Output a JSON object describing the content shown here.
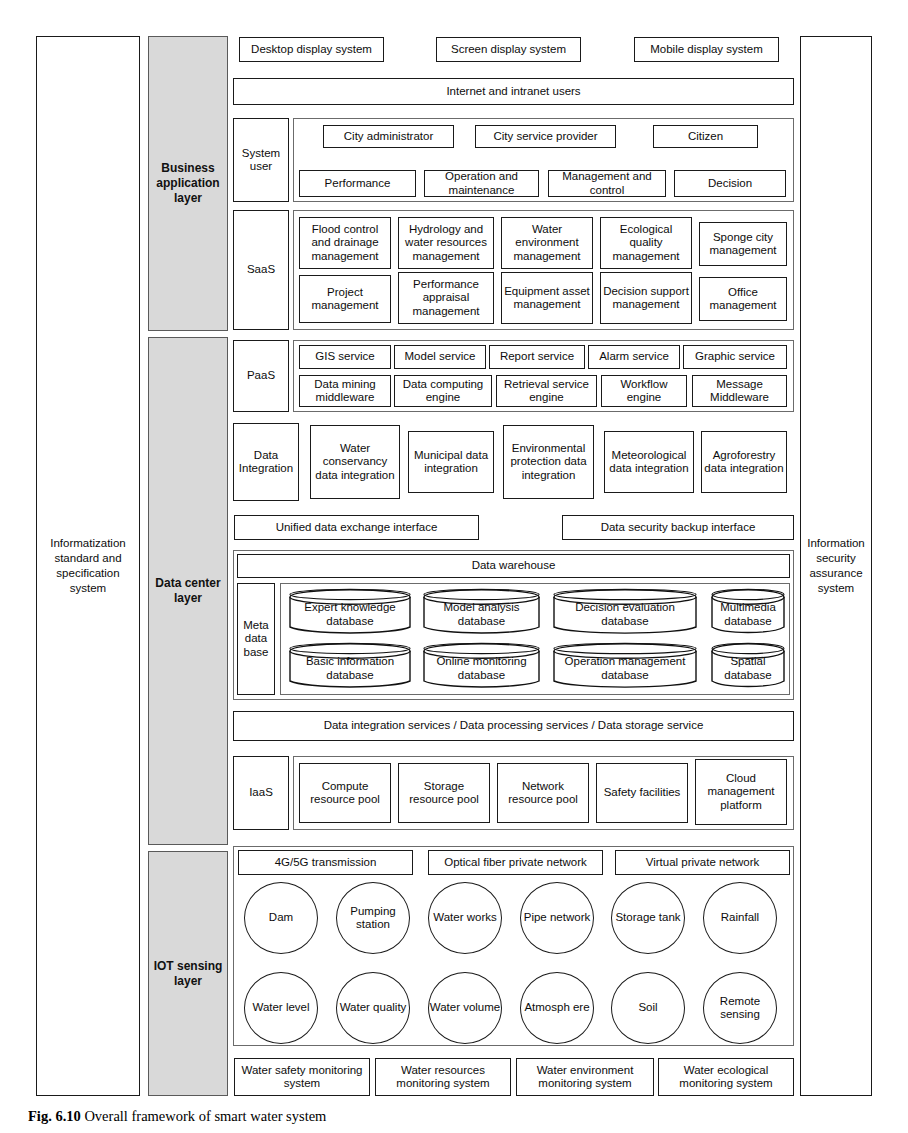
{
  "figure": {
    "caption_label": "Fig. 6.10",
    "caption_text": "Overall framework of smart water system"
  },
  "side_columns": {
    "left": "Informatization standard and specification system",
    "right": "Information security assurance system"
  },
  "layers": [
    {
      "id": "business",
      "label": "Business application layer"
    },
    {
      "id": "data-center",
      "label": "Data center layer"
    },
    {
      "id": "iot",
      "label": "IOT sensing layer"
    }
  ],
  "business_application_layer": {
    "display_systems": [
      "Desktop display system",
      "Screen display system",
      "Mobile display system"
    ],
    "users_bar": "Internet and intranet users",
    "system_user": {
      "label": "System user",
      "roles": [
        "City administrator",
        "City service provider",
        "Citizen"
      ],
      "functions": [
        "Performance",
        "Operation and maintenance",
        "Management and control",
        "Decision"
      ]
    },
    "saas": {
      "label": "SaaS",
      "row1": [
        "Flood control and drainage management",
        "Hydrology and water resources management",
        "Water environment management",
        "Ecological quality management",
        "Sponge city management"
      ],
      "row2": [
        "Project management",
        "Performance appraisal management",
        "Equipment asset management",
        "Decision support management",
        "Office management"
      ]
    }
  },
  "data_center_layer": {
    "paas": {
      "label": "PaaS",
      "row1": [
        "GIS service",
        "Model service",
        "Report service",
        "Alarm service",
        "Graphic service"
      ],
      "row2": [
        "Data mining middleware",
        "Data computing engine",
        "Retrieval service engine",
        "Workflow engine",
        "Message Middleware"
      ]
    },
    "data_integration": {
      "label": "Data Integration",
      "items": [
        "Water conservancy data integration",
        "Municipal data integration",
        "Environmental protection data integration",
        "Meteorological data integration",
        "Agroforestry data integration"
      ]
    },
    "interfaces": [
      "Unified data exchange interface",
      "Data security backup interface"
    ],
    "data_warehouse": "Data warehouse",
    "meta_database": {
      "label": "Meta data base",
      "row1": [
        "Expert knowledge database",
        "Model analysis database",
        "Decision evaluation database",
        "Multimedia database"
      ],
      "row2": [
        "Basic information database",
        "Online monitoring database",
        "Operation management database",
        "Spatial database"
      ]
    },
    "services_bar": "Data integration services / Data processing services / Data storage service",
    "iaas": {
      "label": "IaaS",
      "items": [
        "Compute resource pool",
        "Storage resource pool",
        "Network resource pool",
        "Safety facilities",
        "Cloud management platform"
      ]
    }
  },
  "iot_sensing_layer": {
    "networks": [
      "4G/5G transmission",
      "Optical fiber private network",
      "Virtual private network"
    ],
    "sensors_row1": [
      "Dam",
      "Pumping station",
      "Water works",
      "Pipe network",
      "Storage tank",
      "Rainfall"
    ],
    "sensors_row2": [
      "Water level",
      "Water quality",
      "Water volume",
      "Atmosph ere",
      "Soil",
      "Remote sensing"
    ],
    "monitoring_systems": [
      "Water safety monitoring system",
      "Water resources monitoring system",
      "Water environment monitoring system",
      "Water ecological monitoring system"
    ]
  },
  "colors": {
    "layer_fill": "#d9d9d9",
    "line": "#1a1a1a",
    "group_line": "#6b6b6b",
    "background": "#ffffff"
  }
}
